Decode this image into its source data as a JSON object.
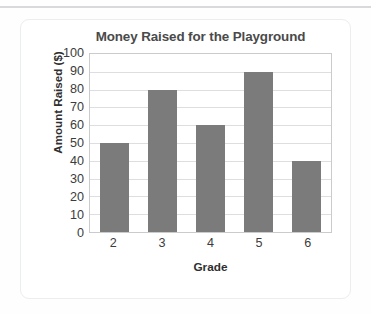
{
  "chart_data": {
    "type": "bar",
    "title": "Money Raised for the Playground",
    "xlabel": "Grade",
    "ylabel": "Amount Raised ($)",
    "categories": [
      "2",
      "3",
      "4",
      "5",
      "6"
    ],
    "values": [
      50,
      80,
      60,
      90,
      40
    ],
    "ylim": [
      0,
      100
    ],
    "ytick_step": 10,
    "yticks": [
      "100",
      "90",
      "80",
      "70",
      "60",
      "50",
      "40",
      "30",
      "20",
      "10",
      "0"
    ],
    "grid": true,
    "legend": false,
    "bar_color": "#7b7b7b",
    "plot_border_color": "#c9cbcd",
    "gridline_color": "#dcdedf",
    "title_color": "#4a4a4a",
    "label_color": "#2f2f2f"
  }
}
